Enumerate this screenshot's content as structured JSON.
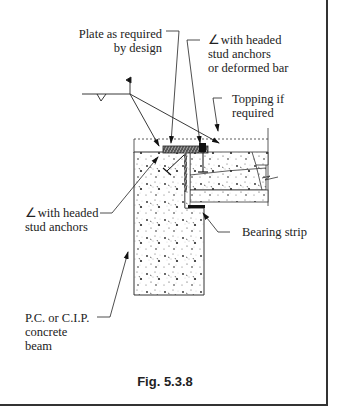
{
  "figure": {
    "caption": "Fig. 5.3.8",
    "labels": {
      "plate": [
        "Plate as required",
        "by design"
      ],
      "angle_top": [
        "with headed",
        "stud anchors",
        "or deformed bar"
      ],
      "topping": [
        "Topping if",
        "required"
      ],
      "angle_left": [
        "with headed",
        "stud anchors"
      ],
      "bearing": "Bearing strip",
      "beam": [
        "P.C. or C.I.P.",
        "concrete",
        "beam"
      ]
    },
    "symbols": {
      "angle": "∠",
      "weld": "weld-symbol"
    },
    "colors": {
      "line": "#222222",
      "background": "#ffffff"
    }
  }
}
